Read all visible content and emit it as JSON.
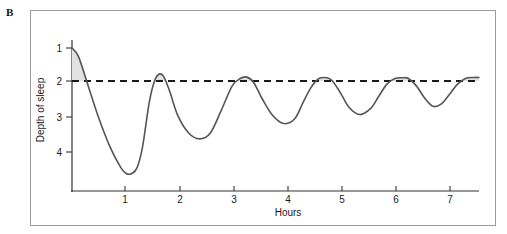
{
  "figure": {
    "panel_letter": "B",
    "background_color": "#ffffff",
    "frame_color": "#9a9a9a"
  },
  "chart_data": {
    "type": "line",
    "title": "",
    "subtitle": "",
    "xlabel": "Hours",
    "ylabel": "Depth of sleep",
    "xlim": [
      0,
      7.5
    ],
    "ylim": [
      4.8,
      0.75
    ],
    "y_axis_inverted": true,
    "grid": false,
    "legend": null,
    "x_ticks": [
      1,
      2,
      3,
      4,
      5,
      6,
      7
    ],
    "x_tick_labels": [
      "1",
      "2",
      "3",
      "4",
      "5",
      "6",
      "7"
    ],
    "y_ticks": [
      1,
      2,
      3,
      4
    ],
    "y_tick_labels": [
      "1",
      "2",
      "3",
      "4"
    ],
    "line_color": "#555555",
    "line_width": 1.6,
    "threshold": {
      "value": 2,
      "style": "dashed",
      "color": "#1a1a1a",
      "label": ""
    },
    "shading": {
      "color": "#e2e2e2",
      "description": "Area between curve and the dashed level-2 line where sleep is lighter than stage 2 (REM episodes)"
    },
    "series": [
      {
        "name": "Sleep stage",
        "x": [
          0.0,
          0.12,
          0.3,
          0.5,
          0.7,
          0.9,
          1.0,
          1.1,
          1.2,
          1.3,
          1.42,
          1.5,
          1.58,
          1.68,
          1.8,
          1.95,
          2.15,
          2.35,
          2.55,
          2.75,
          2.95,
          3.1,
          3.22,
          3.35,
          3.5,
          3.7,
          3.9,
          4.1,
          4.25,
          4.4,
          4.55,
          4.7,
          4.8,
          4.95,
          5.1,
          5.3,
          5.5,
          5.65,
          5.8,
          5.95,
          6.1,
          6.2,
          6.35,
          6.5,
          6.65,
          6.8,
          6.95,
          7.1,
          7.25,
          7.4,
          7.5
        ],
        "y": [
          1.0,
          1.25,
          2.1,
          3.05,
          3.85,
          4.45,
          4.62,
          4.62,
          4.45,
          3.85,
          2.6,
          2.05,
          1.78,
          1.8,
          2.25,
          2.95,
          3.45,
          3.62,
          3.45,
          2.8,
          2.1,
          1.88,
          1.84,
          2.0,
          2.45,
          2.95,
          3.18,
          3.05,
          2.6,
          2.15,
          1.88,
          1.86,
          1.95,
          2.3,
          2.7,
          2.92,
          2.75,
          2.4,
          2.05,
          1.88,
          1.86,
          1.88,
          2.1,
          2.45,
          2.68,
          2.62,
          2.35,
          2.05,
          1.88,
          1.85,
          1.85
        ]
      }
    ],
    "rem_episode_peaks": [
      {
        "hour": 1.58,
        "stage": 1.78
      },
      {
        "hour": 3.22,
        "stage": 1.84
      },
      {
        "hour": 4.72,
        "stage": 1.86
      },
      {
        "hour": 6.13,
        "stage": 1.86
      },
      {
        "hour": 7.45,
        "stage": 1.85
      }
    ],
    "deep_sleep_troughs": [
      {
        "hour": 1.02,
        "stage": 4.62
      },
      {
        "hour": 2.38,
        "stage": 3.62
      },
      {
        "hour": 3.88,
        "stage": 3.18
      },
      {
        "hour": 5.32,
        "stage": 2.92
      },
      {
        "hour": 6.7,
        "stage": 2.68
      }
    ]
  }
}
